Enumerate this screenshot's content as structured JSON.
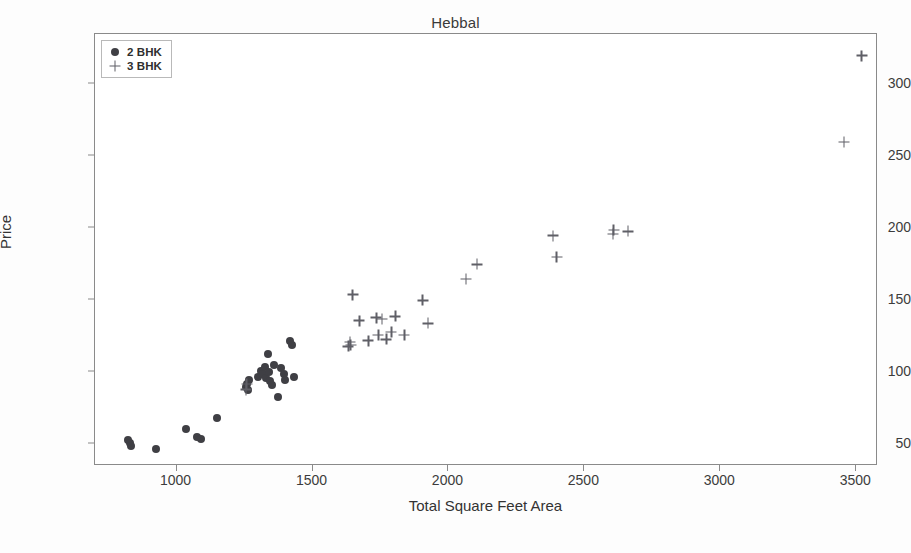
{
  "chart_data": {
    "type": "scatter",
    "title": "Hebbal",
    "xlabel": "Total Square Feet Area",
    "ylabel": "Price",
    "xlim": [
      700,
      3580
    ],
    "ylim": [
      35,
      335
    ],
    "xticks": [
      1000,
      1500,
      2000,
      2500,
      3000,
      3500
    ],
    "yticks": [
      50,
      100,
      150,
      200,
      250,
      300
    ],
    "grid": false,
    "legend_position": "upper left",
    "series": [
      {
        "name": "2 BHK",
        "marker": "circle",
        "color": "#3f3f44",
        "points": [
          [
            820,
            53
          ],
          [
            828,
            51
          ],
          [
            832,
            49
          ],
          [
            925,
            47
          ],
          [
            1035,
            61
          ],
          [
            1075,
            55
          ],
          [
            1090,
            54
          ],
          [
            1150,
            68
          ],
          [
            1255,
            90
          ],
          [
            1258,
            92
          ],
          [
            1262,
            88
          ],
          [
            1268,
            95
          ],
          [
            1300,
            97
          ],
          [
            1310,
            101
          ],
          [
            1318,
            99
          ],
          [
            1325,
            104
          ],
          [
            1330,
            96
          ],
          [
            1335,
            113
          ],
          [
            1340,
            100
          ],
          [
            1345,
            94
          ],
          [
            1352,
            91
          ],
          [
            1360,
            105
          ],
          [
            1372,
            83
          ],
          [
            1385,
            103
          ],
          [
            1395,
            99
          ],
          [
            1400,
            95
          ],
          [
            1418,
            122
          ],
          [
            1425,
            119
          ],
          [
            1432,
            97
          ]
        ]
      },
      {
        "name": "3 BHK",
        "marker": "plus",
        "color": "#5f5f66",
        "points": [
          [
            1255,
            88
          ],
          [
            1258,
            92
          ],
          [
            1632,
            118
          ],
          [
            1638,
            121
          ],
          [
            1640,
            119
          ],
          [
            1648,
            154
          ],
          [
            1672,
            136
          ],
          [
            1705,
            122
          ],
          [
            1735,
            138
          ],
          [
            1742,
            126
          ],
          [
            1755,
            137
          ],
          [
            1772,
            123
          ],
          [
            1790,
            128
          ],
          [
            1805,
            139
          ],
          [
            1838,
            126
          ],
          [
            1905,
            150
          ],
          [
            1925,
            134
          ],
          [
            2065,
            165
          ],
          [
            2105,
            175
          ],
          [
            2385,
            195
          ],
          [
            2398,
            180
          ],
          [
            2605,
            196
          ],
          [
            2608,
            199
          ],
          [
            2660,
            198
          ],
          [
            3455,
            260
          ],
          [
            3520,
            320
          ]
        ]
      }
    ]
  },
  "legend": {
    "items": [
      {
        "label": "2 BHK",
        "marker": "circle"
      },
      {
        "label": "3 BHK",
        "marker": "plus"
      }
    ]
  }
}
